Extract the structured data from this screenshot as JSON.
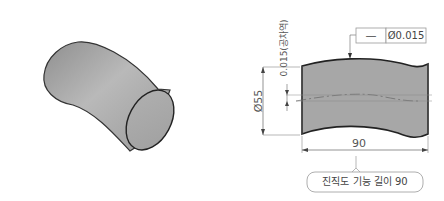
{
  "figure": {
    "left_view": {
      "name": "isometric-bent-cylinder"
    },
    "right_view": {
      "name": "straightness-drawing",
      "tolerance_frame": {
        "symbol": "—",
        "value": "Ø0.015"
      },
      "tolerance_zone_label": "0.015(공차역)",
      "diameter_label": "Ø55",
      "length_label": "90",
      "callout": "진직도 기능 길이 90"
    }
  }
}
